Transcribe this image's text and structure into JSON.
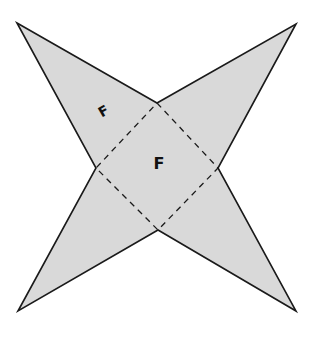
{
  "diagram": {
    "type": "net of square pyramid (star shape)",
    "colors": {
      "fill": "#d9d9d9",
      "stroke": "#1a1a1a",
      "background": "#ffffff"
    },
    "base_square": {
      "vertices": [
        [
          157,
          103
        ],
        [
          218,
          168
        ],
        [
          158,
          230
        ],
        [
          96,
          168
        ]
      ],
      "edge_style": "dashed"
    },
    "triangles": [
      {
        "name": "top-left",
        "apex": [
          17,
          23
        ],
        "base": [
          [
            157,
            103
          ],
          [
            96,
            168
          ]
        ]
      },
      {
        "name": "top-right",
        "apex": [
          296,
          24
        ],
        "base": [
          [
            157,
            103
          ],
          [
            218,
            168
          ]
        ]
      },
      {
        "name": "bottom-right",
        "apex": [
          296,
          311
        ],
        "base": [
          [
            218,
            168
          ],
          [
            158,
            230
          ]
        ]
      },
      {
        "name": "bottom-left",
        "apex": [
          18,
          311
        ],
        "base": [
          [
            158,
            230
          ],
          [
            96,
            168
          ]
        ]
      }
    ],
    "labels": [
      {
        "text": "F",
        "x": 104,
        "y": 112,
        "rotate": -30,
        "location": "top-left triangle face"
      },
      {
        "text": "F",
        "x": 159,
        "y": 164,
        "rotate": 0,
        "location": "base square face"
      }
    ]
  }
}
